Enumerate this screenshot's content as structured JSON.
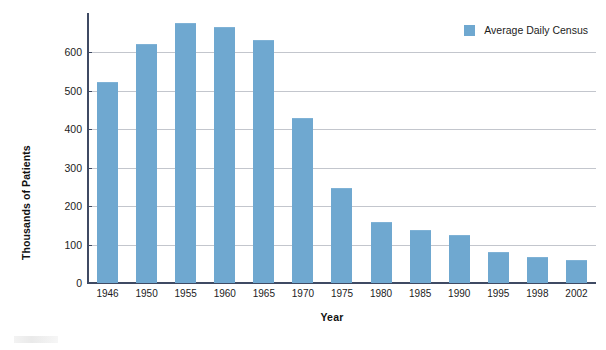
{
  "chart_data": {
    "type": "bar",
    "title": "",
    "subtitle": "",
    "xlabel": "Year",
    "ylabel": "Thousands of Patients",
    "categories": [
      "1946",
      "1950",
      "1955",
      "1960",
      "1965",
      "1970",
      "1975",
      "1980",
      "1985",
      "1990",
      "1995",
      "1998",
      "2002"
    ],
    "series": [
      {
        "name": "Average Daily Census",
        "values": [
          520,
          620,
          675,
          663,
          630,
          428,
          245,
          157,
          135,
          122,
          79,
          66,
          57
        ],
        "color": "#6fa8d0"
      }
    ],
    "ylim": [
      0,
      700
    ],
    "y_ticks": [
      0,
      100,
      200,
      300,
      400,
      500,
      600
    ],
    "y_tick_labels": [
      "0",
      "100",
      "200",
      "300",
      "400",
      "500",
      "600"
    ],
    "grid": true,
    "grid_color": "#b9bcc4",
    "legend_position": "top-right",
    "annotations": []
  },
  "legend": {
    "entries": [
      {
        "label": "Average Daily Census",
        "color": "#6fa8d0",
        "swatch_name": "legend-color-swatch"
      }
    ]
  },
  "axes": {
    "y_title": "Thousands of Patients",
    "x_title": "Year",
    "axis_color": "#3f4a63"
  },
  "colors": {
    "bar": "#6fa8d0",
    "grid": "#b9bcc4",
    "axis": "#3f4a63",
    "background": "#ffffff",
    "text": "#1c1c1c"
  }
}
